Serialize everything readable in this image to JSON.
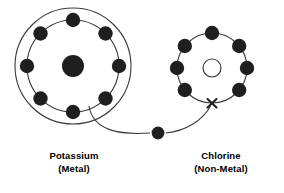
{
  "diagram": {
    "type": "atomic-electron-transfer",
    "background_color": "#ffffff",
    "stroke_color": "#1a1a1a",
    "electron_color": "#1f1f1f",
    "width": 284,
    "height": 193
  },
  "atoms": [
    {
      "id": "potassium",
      "name": "Potassium",
      "classification": "(Metal)",
      "label_line1": "Potassium",
      "label_line2": "(Metal)",
      "center": {
        "x": 73,
        "y": 66
      },
      "nucleus": {
        "style": "filled",
        "radius": 11
      },
      "shells": [
        {
          "index": 1,
          "radius": 46,
          "electron_count": 8,
          "drawn": true
        },
        {
          "index": 2,
          "radius": 58,
          "electron_count": 0,
          "drawn": true
        }
      ],
      "electron_radius": 7,
      "electron_angles_deg": [
        90,
        135,
        180,
        225,
        270,
        315,
        0,
        45
      ]
    },
    {
      "id": "chlorine",
      "name": "Chlorine",
      "classification": "(Non-Metal)",
      "label_line1": "Chlorine",
      "label_line2": "(Non-Metal)",
      "center": {
        "x": 212,
        "y": 68
      },
      "nucleus": {
        "style": "hollow",
        "radius": 9
      },
      "shells": [
        {
          "index": 1,
          "radius": 35,
          "electron_count": 7,
          "drawn": true
        }
      ],
      "electron_radius": 7,
      "electron_angles_deg": [
        90,
        141,
        180,
        219,
        270,
        321,
        39
      ],
      "vacancy_marker": {
        "symbol": "X",
        "angle_deg": 270,
        "x": 212,
        "y": 103
      }
    }
  ],
  "transfer": {
    "free_electron": {
      "x": 158,
      "y": 133,
      "radius": 6
    },
    "path_from": "potassium-outer-shell",
    "path_to": "chlorine-vacancy-X",
    "start": {
      "x": 90,
      "y": 110
    },
    "end": {
      "x": 210,
      "y": 106
    }
  },
  "labels": {
    "potassium": {
      "line1": "Potassium",
      "line2": "(Metal)"
    },
    "chlorine": {
      "line1": "Chlorine",
      "line2": "(Non-Metal)"
    }
  }
}
